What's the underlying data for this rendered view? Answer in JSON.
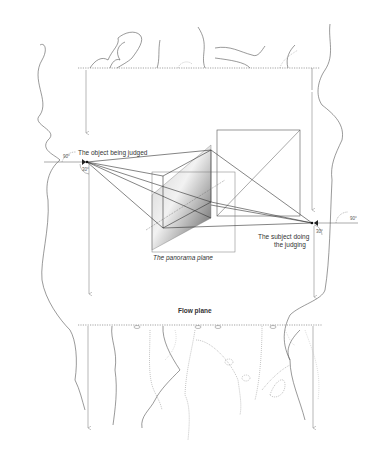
{
  "diagram": {
    "labels": {
      "object": "The object being judged",
      "subject_line1": "The subject doing",
      "subject_line2": "the judging",
      "panorama": "The panorama plane",
      "flow": "Flow plane",
      "angle_left_top": "90°",
      "angle_left_bottom": "30°",
      "angle_right_top": "90°",
      "angle_right_bottom": "30°"
    },
    "colors": {
      "line": "#444444",
      "arrow": "#888888",
      "dotted": "#666666",
      "panel_dark": "#6e6e6e",
      "panel_light": "#d9d9d9"
    }
  }
}
